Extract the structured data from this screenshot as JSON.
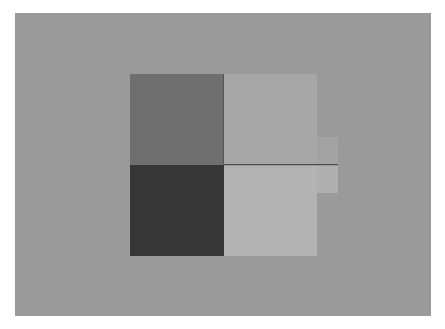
{
  "figure": {
    "background_color": "#9a9a9a",
    "blocks": [
      {
        "position": "top-left",
        "color": "#6f6f6f"
      },
      {
        "position": "top-right",
        "color": "#a7a7a7"
      },
      {
        "position": "bottom-left",
        "color": "#363636"
      },
      {
        "position": "bottom-right",
        "color": "#b3b3b3"
      }
    ]
  }
}
